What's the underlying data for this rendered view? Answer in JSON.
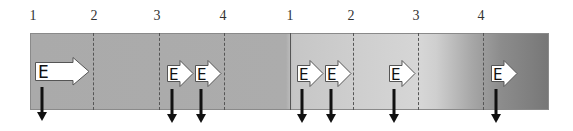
{
  "diagram": {
    "title": "",
    "beat_labels": [
      {
        "text": "1",
        "x": 33
      },
      {
        "text": "2",
        "x": 94
      },
      {
        "text": "3",
        "x": 157
      },
      {
        "text": "4",
        "x": 223
      },
      {
        "text": "1",
        "x": 290
      },
      {
        "text": "2",
        "x": 351
      },
      {
        "text": "3",
        "x": 416
      },
      {
        "text": "4",
        "x": 481
      }
    ],
    "dividers": [
      {
        "x": 93,
        "style": "dashed"
      },
      {
        "x": 159,
        "style": "dashed"
      },
      {
        "x": 224,
        "style": "dashed"
      },
      {
        "x": 290,
        "style": "solid"
      },
      {
        "x": 353,
        "style": "dashed"
      },
      {
        "x": 418,
        "style": "dashed"
      },
      {
        "x": 483,
        "style": "dashed"
      }
    ],
    "e_arrows": [
      {
        "label": "E",
        "size": "large",
        "x": 35,
        "down_x": 42
      },
      {
        "label": "E",
        "size": "small",
        "x": 167,
        "down_x": 172
      },
      {
        "label": "E",
        "size": "small",
        "x": 195,
        "down_x": 201
      },
      {
        "label": "E",
        "size": "small",
        "x": 297,
        "down_x": 302
      },
      {
        "label": "E",
        "size": "small",
        "x": 325,
        "down_x": 331
      },
      {
        "label": "E",
        "size": "small",
        "x": 389,
        "down_x": 394
      },
      {
        "label": "E",
        "size": "small",
        "x": 491,
        "down_x": 496
      }
    ],
    "colors": {
      "bar_start": "#aaaaaa",
      "bar_light": "#d6d6d6",
      "bar_end": "#767676",
      "arrow_fill": "#ffffff",
      "arrow_stroke": "#555555",
      "down_arrow": "#111111"
    }
  }
}
